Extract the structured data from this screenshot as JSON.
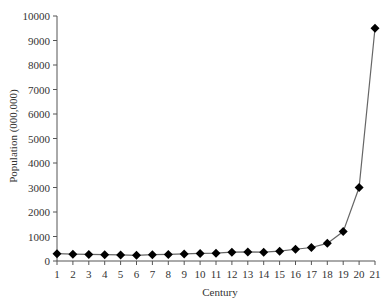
{
  "chart_data": {
    "type": "line",
    "title": "",
    "xlabel": "Century",
    "ylabel": "Population (000,000)",
    "categories": [
      "1",
      "2",
      "3",
      "4",
      "5",
      "6",
      "7",
      "8",
      "9",
      "10",
      "11",
      "12",
      "13",
      "14",
      "15",
      "16",
      "17",
      "18",
      "19",
      "20",
      "21"
    ],
    "series": [
      {
        "name": "Population",
        "marker": "diamond",
        "color": "#000000",
        "values": [
          300,
          280,
          270,
          260,
          250,
          230,
          260,
          270,
          290,
          310,
          320,
          360,
          370,
          360,
          400,
          480,
          550,
          720,
          1200,
          3000,
          9500
        ]
      }
    ],
    "yticks": [
      0,
      1000,
      2000,
      3000,
      4000,
      5000,
      6000,
      7000,
      8000,
      9000,
      10000
    ],
    "ylim": [
      0,
      10000
    ],
    "grid": false,
    "legend": "none"
  },
  "labels": {
    "xtitle": "Century",
    "ytitle": "Population (000,000)"
  }
}
